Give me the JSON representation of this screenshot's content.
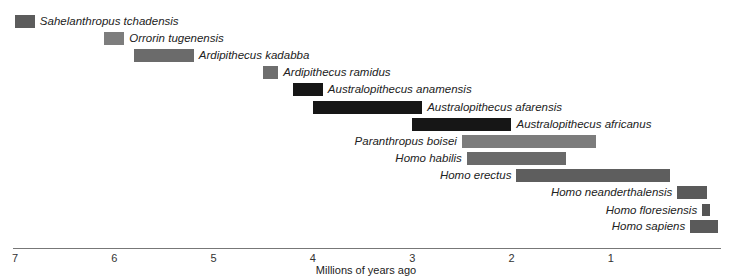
{
  "chart_data": {
    "type": "bar",
    "orientation": "horizontal-range",
    "title": "",
    "xlabel": "Millions of years ago",
    "ylabel": "",
    "xlim": [
      7,
      0
    ],
    "x_ticks": [
      7,
      6,
      5,
      4,
      3,
      2,
      1
    ],
    "grid": false,
    "legend": null,
    "series": [
      {
        "name": "Sahelanthropus tchadensis",
        "start": 7.0,
        "end": 6.8,
        "color": "#5c5c5c",
        "label_side": "right"
      },
      {
        "name": "Orrorin tugenensis",
        "start": 6.1,
        "end": 5.9,
        "color": "#7d7d7d",
        "label_side": "right"
      },
      {
        "name": "Ardipithecus kadabba",
        "start": 5.8,
        "end": 5.2,
        "color": "#6b6b6b",
        "label_side": "right"
      },
      {
        "name": "Ardipithecus ramidus",
        "start": 4.5,
        "end": 4.35,
        "color": "#6e6e6e",
        "label_side": "right"
      },
      {
        "name": "Australopithecus anamensis",
        "start": 4.2,
        "end": 3.9,
        "color": "#161616",
        "label_side": "right"
      },
      {
        "name": "Australopithecus afarensis",
        "start": 4.0,
        "end": 2.9,
        "color": "#161616",
        "label_side": "right"
      },
      {
        "name": "Australopithecus africanus",
        "start": 3.0,
        "end": 2.0,
        "color": "#161616",
        "label_side": "right"
      },
      {
        "name": "Paranthropus boisei",
        "start": 2.5,
        "end": 1.15,
        "color": "#7c7c7c",
        "label_side": "left"
      },
      {
        "name": "Homo habilis",
        "start": 2.45,
        "end": 1.45,
        "color": "#6a6a6a",
        "label_side": "left"
      },
      {
        "name": "Homo erectus",
        "start": 1.95,
        "end": 0.4,
        "color": "#5e5e5e",
        "label_side": "left"
      },
      {
        "name": "Homo neanderthalensis",
        "start": 0.33,
        "end": 0.03,
        "color": "#5a5a5a",
        "label_side": "left"
      },
      {
        "name": "Homo floresiensis",
        "start": 0.08,
        "end": 0.0,
        "color": "#555555",
        "label_side": "left"
      },
      {
        "name": "Homo sapiens",
        "start": 0.2,
        "end": -0.08,
        "color": "#5a5a5a",
        "label_side": "left"
      }
    ]
  },
  "axis": {
    "ticks": [
      "7",
      "6",
      "5",
      "4",
      "3",
      "2",
      "1"
    ],
    "xlabel": "Millions of years ago"
  }
}
